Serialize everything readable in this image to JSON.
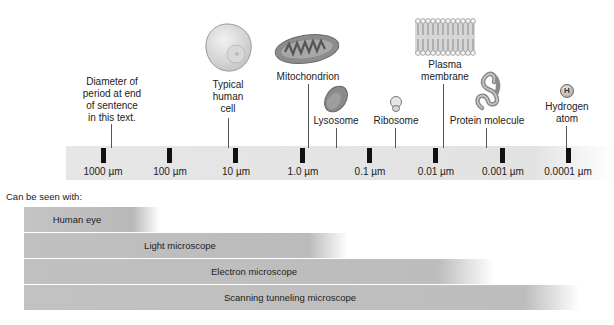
{
  "diagram": {
    "scale": {
      "ticks": [
        {
          "label": "1000 µm",
          "x": 103
        },
        {
          "label": "100 µm",
          "x": 170
        },
        {
          "label": "10 µm",
          "x": 236
        },
        {
          "label": "1.0 µm",
          "x": 303
        },
        {
          "label": "0.1 µm",
          "x": 370
        },
        {
          "label": "0.01 µm",
          "x": 436
        },
        {
          "label": "0.001 µm",
          "x": 503
        },
        {
          "label": "0.0001 µm",
          "x": 570
        }
      ]
    },
    "objects": [
      {
        "name": "period",
        "label_lines": [
          "Diameter of",
          "period at end",
          "of sentence",
          "in this text."
        ]
      },
      {
        "name": "cell",
        "label_lines": [
          "Typical",
          "human",
          "cell"
        ]
      },
      {
        "name": "mitochondrion",
        "label_lines": [
          "Mitochondrion"
        ]
      },
      {
        "name": "lysosome",
        "label_lines": [
          "Lysosome"
        ]
      },
      {
        "name": "ribosome",
        "label_lines": [
          "Ribosome"
        ]
      },
      {
        "name": "plasma-membrane",
        "label_lines": [
          "Plasma",
          "membrane"
        ]
      },
      {
        "name": "protein",
        "label_lines": [
          "Protein molecule"
        ]
      },
      {
        "name": "hydrogen",
        "label_lines": [
          "Hydrogen",
          "atom"
        ],
        "symbol": "H"
      }
    ],
    "seen_with_label": "Can be seen with:",
    "instruments": [
      {
        "label": "Human eye"
      },
      {
        "label": "Light microscope"
      },
      {
        "label": "Electron microscope"
      },
      {
        "label": "Scanning tunneling microscope"
      }
    ],
    "colors": {
      "band": "#e4e4e4",
      "bar": "#b8b8b8",
      "tick": "#111111",
      "organelle": "#8a8a8a"
    }
  }
}
